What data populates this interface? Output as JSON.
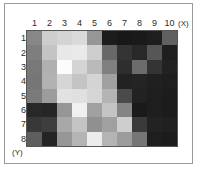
{
  "chart_data": {
    "type": "heatmap",
    "title": "",
    "xlabel": "(X)",
    "ylabel": "(Y)",
    "x_tick_labels": [
      "1",
      "2",
      "3",
      "4",
      "5",
      "6",
      "7",
      "8",
      "9",
      "10"
    ],
    "y_tick_labels": [
      "1",
      "2",
      "3",
      "4",
      "5",
      "6",
      "7",
      "8"
    ],
    "colormap": "grayscale",
    "value_range": [
      0,
      255
    ],
    "grid": false,
    "legend": "none",
    "n_cols": 10,
    "n_rows": 8,
    "values": [
      [
        135,
        205,
        212,
        218,
        150,
        28,
        24,
        26,
        30,
        96
      ],
      [
        126,
        196,
        232,
        234,
        206,
        104,
        52,
        40,
        86,
        30
      ],
      [
        120,
        176,
        252,
        212,
        186,
        128,
        46,
        108,
        52,
        34
      ],
      [
        118,
        178,
        214,
        196,
        212,
        160,
        34,
        36,
        32,
        30
      ],
      [
        122,
        156,
        226,
        224,
        214,
        180,
        74,
        34,
        30,
        28
      ],
      [
        40,
        38,
        150,
        240,
        160,
        196,
        132,
        26,
        30,
        28
      ],
      [
        56,
        62,
        168,
        196,
        144,
        160,
        206,
        58,
        34,
        32
      ],
      [
        94,
        36,
        150,
        180,
        236,
        180,
        156,
        118,
        30,
        28
      ]
    ]
  },
  "axis": {
    "x_title": "(X)",
    "y_title": "(Y)"
  }
}
